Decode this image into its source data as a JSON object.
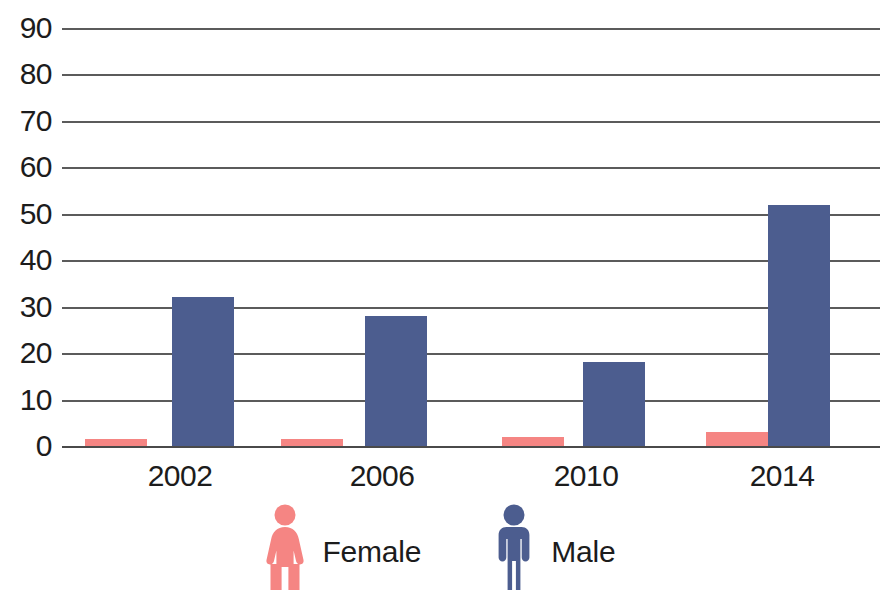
{
  "chart_data": {
    "type": "bar",
    "title": "",
    "subtitle": "",
    "xlabel": "",
    "ylabel": "",
    "categories": [
      "2002",
      "2006",
      "2010",
      "2014"
    ],
    "series": [
      {
        "name": "Female",
        "color": "#f58583",
        "values": [
          1.5,
          1.5,
          2,
          3
        ]
      },
      {
        "name": "Male",
        "color": "#4c5d8f",
        "values": [
          32,
          28,
          18,
          52
        ]
      }
    ],
    "ylim": [
      0,
      90
    ],
    "y_ticks": [
      90,
      80,
      70,
      60,
      50,
      40,
      30,
      20,
      10,
      0
    ],
    "grid": true,
    "legend_position": "bottom",
    "legend": [
      {
        "label": "Female",
        "icon": "female-figure-icon",
        "color": "#f58583"
      },
      {
        "label": "Male",
        "icon": "male-figure-icon",
        "color": "#4c5d8f"
      }
    ],
    "annotations": []
  },
  "colors": {
    "female": "#f58583",
    "male": "#4c5d8f",
    "gridline": "#5b5b5b",
    "text": "#1c1c1c",
    "background": "#ffffff"
  }
}
